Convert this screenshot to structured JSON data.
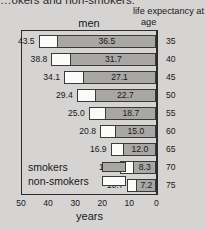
{
  "top_caption": "…okers and non-smokers.",
  "y_axis_heading": {
    "line1": "life expectancy at",
    "line2": "age"
  },
  "chart_title": "men",
  "x_axis_label": "years",
  "legend": {
    "smokers_label": "smokers",
    "non_smokers_label": "non-smokers"
  },
  "chart_data": {
    "type": "bar",
    "orientation": "horizontal",
    "subtype": "stacked",
    "title": "men",
    "xlabel": "years",
    "ylabel": "life expectancy at age",
    "xlim": [
      50,
      0
    ],
    "x_reversed": true,
    "xticks": [
      50,
      40,
      30,
      20,
      10,
      0
    ],
    "grid": false,
    "legend_position": "inside-bottom-left",
    "categories": [
      "35",
      "40",
      "45",
      "50",
      "55",
      "60",
      "65",
      "70",
      "75"
    ],
    "series": [
      {
        "name": "non-smokers",
        "color": "#fbfbf9",
        "description": "total life expectancy remaining (outer label at left end of bar)",
        "values": [
          43.5,
          38.8,
          34.1,
          29.4,
          25.0,
          20.8,
          16.9,
          13.5,
          10.7
        ]
      },
      {
        "name": "smokers",
        "color": "#a9a7a4",
        "description": "life expectancy remaining for smokers (label inside gray segment)",
        "values": [
          36.5,
          31.7,
          27.1,
          22.7,
          18.7,
          15.0,
          12.0,
          8.3,
          7.2
        ]
      }
    ]
  },
  "colors": {
    "background": "#d6d4d2",
    "smoker_fill": "#a9a7a4",
    "non_smoker_fill": "#fbfbf9",
    "outline": "#2b2b2e",
    "text": "#17171a"
  }
}
